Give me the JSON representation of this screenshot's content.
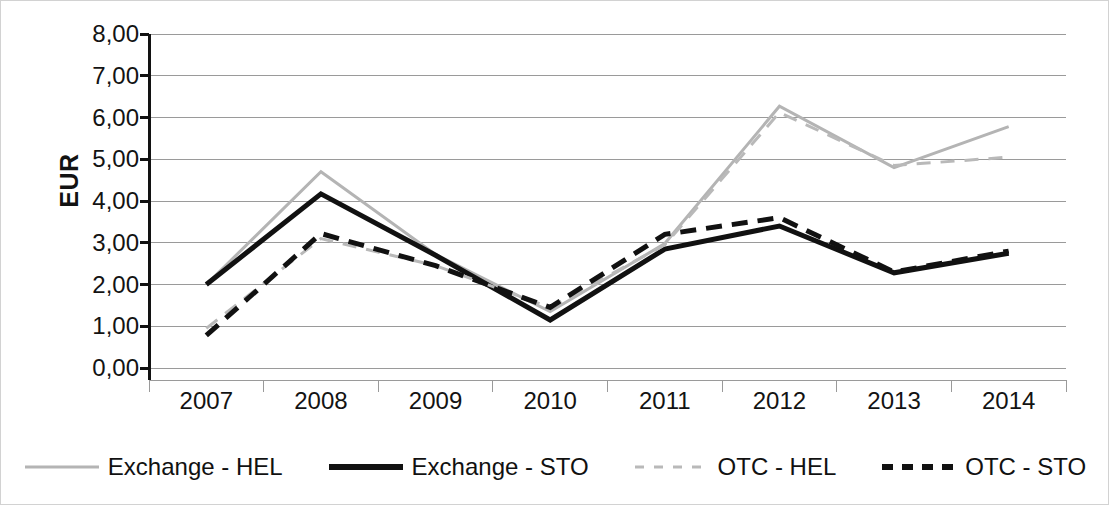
{
  "chart_data": {
    "type": "line",
    "title": "",
    "xlabel": "",
    "ylabel": "EUR",
    "categories": [
      "2007",
      "2008",
      "2009",
      "2010",
      "2011",
      "2012",
      "2013",
      "2014"
    ],
    "ylim": [
      0,
      8
    ],
    "ytick_labels": [
      "8,00",
      "7,00",
      "6,00",
      "5,00",
      "4,00",
      "3,00",
      "2,00",
      "1,00",
      "0,00"
    ],
    "ytick_values": [
      8,
      7,
      6,
      5,
      4,
      3,
      2,
      1,
      0
    ],
    "grid": true,
    "legend_position": "bottom",
    "decimal_separator": ",",
    "series": [
      {
        "name": "Exchange - HEL",
        "color": "#b4b4b4",
        "style": "solid",
        "values": [
          2.0,
          4.7,
          2.72,
          1.35,
          2.98,
          6.27,
          4.8,
          5.78
        ]
      },
      {
        "name": "Exchange - STO",
        "color": "#111111",
        "style": "solid",
        "values": [
          2.0,
          4.17,
          2.7,
          1.15,
          2.85,
          3.4,
          2.28,
          2.75
        ]
      },
      {
        "name": "OTC - HEL",
        "color": "#b9b9b9",
        "style": "dashed",
        "values": [
          0.95,
          3.1,
          2.45,
          1.45,
          2.95,
          6.12,
          4.85,
          5.05
        ]
      },
      {
        "name": "OTC - STO",
        "color": "#111111",
        "style": "dashed",
        "values": [
          0.78,
          3.22,
          2.45,
          1.45,
          3.2,
          3.6,
          2.3,
          2.8
        ]
      }
    ]
  },
  "colors": {
    "gray_series": "#b4b4b4",
    "black_series": "#111111",
    "gridline": "#9a9a9a",
    "axis": "#121212",
    "border": "#d2d2d2"
  }
}
